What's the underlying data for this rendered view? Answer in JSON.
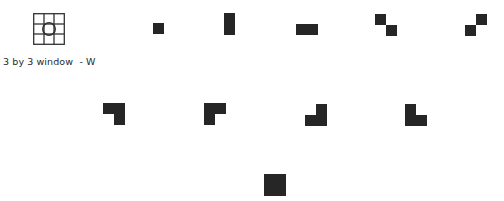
{
  "legend": {
    "icon": "grid-3x3-window-icon",
    "caption": "3 by 3 window  - W"
  },
  "colors": {
    "fill": "#262626",
    "grid_line": "#333333",
    "background": "#ffffff"
  },
  "cell_size": 11,
  "shapes": [
    {
      "id": "single-square",
      "x": 153,
      "y": 23,
      "cells": [
        [
          0,
          0
        ]
      ]
    },
    {
      "id": "vertical-domino",
      "x": 224,
      "y": 13,
      "cells": [
        [
          0,
          0
        ],
        [
          0,
          1
        ]
      ]
    },
    {
      "id": "horizontal-domino",
      "x": 296,
      "y": 24,
      "cells": [
        [
          0,
          0
        ],
        [
          1,
          0
        ]
      ]
    },
    {
      "id": "diagonal-pair",
      "x": 375,
      "y": 14,
      "cells": [
        [
          0,
          0
        ],
        [
          1,
          1
        ]
      ]
    },
    {
      "id": "anti-diagonal-pair",
      "x": 465,
      "y": 14,
      "cells": [
        [
          1,
          0
        ],
        [
          0,
          1
        ]
      ]
    },
    {
      "id": "l-tromino-top-right-corner",
      "x": 103,
      "y": 103,
      "cells": [
        [
          0,
          0
        ],
        [
          1,
          0
        ],
        [
          1,
          1
        ]
      ]
    },
    {
      "id": "l-tromino-top-left-corner",
      "x": 204,
      "y": 103,
      "cells": [
        [
          0,
          0
        ],
        [
          1,
          0
        ],
        [
          0,
          1
        ]
      ]
    },
    {
      "id": "l-tromino-bottom-right-corner",
      "x": 305,
      "y": 104,
      "cells": [
        [
          1,
          0
        ],
        [
          0,
          1
        ],
        [
          1,
          1
        ]
      ]
    },
    {
      "id": "l-tromino-bottom-left-corner",
      "x": 405,
      "y": 104,
      "cells": [
        [
          0,
          0
        ],
        [
          0,
          1
        ],
        [
          1,
          1
        ]
      ]
    },
    {
      "id": "full-2x2-square",
      "x": 264,
      "y": 174,
      "cells": [
        [
          0,
          0
        ],
        [
          1,
          0
        ],
        [
          0,
          1
        ],
        [
          1,
          1
        ]
      ]
    }
  ]
}
